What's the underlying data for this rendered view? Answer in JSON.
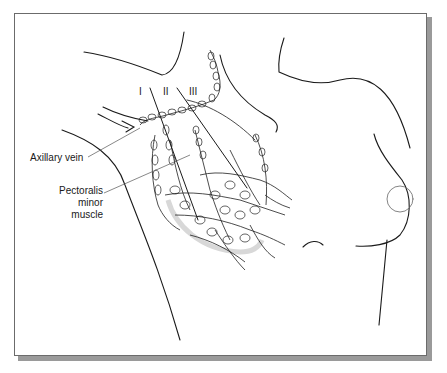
{
  "figure": {
    "labels": {
      "axillary_vein": "Axillary vein",
      "pectoralis_line1": "Pectoralis",
      "pectoralis_line2": "minor muscle"
    },
    "levels": [
      "I",
      "II",
      "III"
    ],
    "colors": {
      "line": "#1a1a1a",
      "leader": "#555555",
      "frame_border": "#6b6b6b",
      "shadow": "#9a9a9a",
      "muscle_shade": "#d8d8d8"
    }
  }
}
